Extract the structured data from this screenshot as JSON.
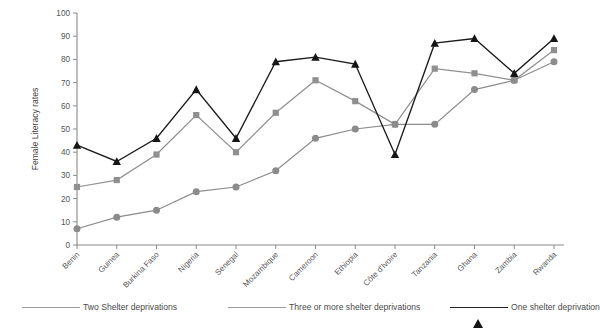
{
  "chart_data": {
    "type": "line",
    "title": "",
    "xlabel": "",
    "ylabel": "Female Literacy rates",
    "ylim": [
      0,
      100
    ],
    "yticks": [
      0,
      10,
      20,
      30,
      40,
      50,
      60,
      70,
      80,
      90,
      100
    ],
    "grid": false,
    "legend_position": "bottom",
    "categories": [
      "Benin",
      "Guinea",
      "Burkina Faso",
      "Nigeria",
      "Senegal",
      "Mozambique",
      "Cameroon",
      "Ethiopia",
      "Côte d'Ivoire",
      "Tanzania",
      "Ghana",
      "Zambia",
      "Rwanda"
    ],
    "series": [
      {
        "name": "Two Shelter deprivations",
        "marker": "square",
        "color": "#8f8f8f",
        "values": [
          25,
          28,
          39,
          56,
          40,
          57,
          71,
          62,
          52,
          76,
          74,
          71,
          84
        ]
      },
      {
        "name": "Three or more shelter deprivations",
        "marker": "circle",
        "color": "#8b8b8b",
        "values": [
          7,
          12,
          15,
          23,
          25,
          32,
          46,
          50,
          52,
          52,
          67,
          71,
          79
        ]
      },
      {
        "name": "One shelter deprivation",
        "marker": "triangle",
        "color": "#151515",
        "values": [
          43,
          36,
          46,
          67,
          46,
          79,
          81,
          78,
          39,
          87,
          89,
          74,
          89
        ]
      }
    ]
  },
  "axis": {
    "y_label": "Female Literacy rates",
    "y_tick_labels": [
      "100",
      "90",
      "80",
      "70",
      "60",
      "50",
      "40",
      "30",
      "20",
      "10",
      "0"
    ]
  },
  "legend": {
    "items": [
      {
        "label": "Two Shelter deprivations",
        "marker": "square-marker"
      },
      {
        "label": "Three or more shelter deprivations",
        "marker": "circle-marker"
      },
      {
        "label": "One shelter deprivation",
        "marker": "triangle-marker"
      }
    ]
  }
}
